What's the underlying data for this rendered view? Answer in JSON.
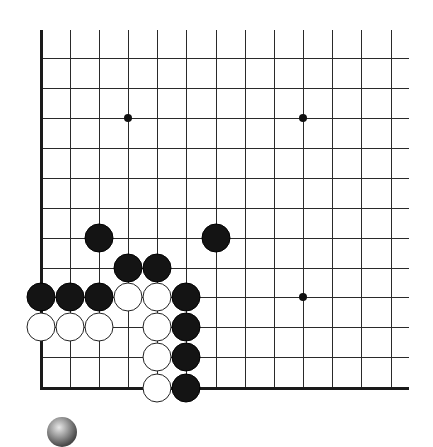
{
  "board": {
    "grid": {
      "x_lines": [
        41,
        70,
        99,
        128,
        157,
        186,
        216,
        245,
        274,
        303,
        332,
        361,
        391
      ],
      "y_lines": [
        58,
        88,
        118,
        148,
        178,
        208,
        238,
        268,
        297,
        327,
        357,
        388
      ],
      "top": 30,
      "right": 409,
      "left_edge_x": 41,
      "bottom_edge_y": 388
    },
    "hoshi": [
      {
        "x": 128,
        "y": 118
      },
      {
        "x": 303,
        "y": 118
      },
      {
        "x": 303,
        "y": 297
      }
    ],
    "stones": [
      {
        "color": "black",
        "x": 99,
        "y": 238
      },
      {
        "color": "black",
        "x": 216,
        "y": 238
      },
      {
        "color": "black",
        "x": 128,
        "y": 268
      },
      {
        "color": "black",
        "x": 157,
        "y": 268
      },
      {
        "color": "black",
        "x": 41,
        "y": 297
      },
      {
        "color": "black",
        "x": 70,
        "y": 297
      },
      {
        "color": "black",
        "x": 99,
        "y": 297
      },
      {
        "color": "white",
        "x": 128,
        "y": 297
      },
      {
        "color": "white",
        "x": 157,
        "y": 297
      },
      {
        "color": "black",
        "x": 186,
        "y": 297
      },
      {
        "color": "white",
        "x": 41,
        "y": 327
      },
      {
        "color": "white",
        "x": 70,
        "y": 327
      },
      {
        "color": "white",
        "x": 99,
        "y": 327
      },
      {
        "color": "white",
        "x": 157,
        "y": 327
      },
      {
        "color": "black",
        "x": 186,
        "y": 327
      },
      {
        "color": "white",
        "x": 157,
        "y": 357
      },
      {
        "color": "black",
        "x": 186,
        "y": 357
      },
      {
        "color": "white",
        "x": 157,
        "y": 388
      },
      {
        "color": "black",
        "x": 186,
        "y": 388
      }
    ],
    "colors": {
      "black_stone": "#141414",
      "white_stone": "#ffffff",
      "line": "#2a2a2a"
    }
  },
  "turn_indicator": {
    "icon": "stone-icon",
    "color": "gray"
  }
}
